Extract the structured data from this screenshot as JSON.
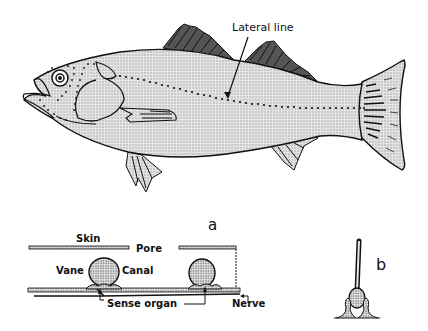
{
  "figure": {
    "fish": {
      "label_lateral_line": "Lateral line"
    },
    "panel_a": {
      "panel_label": "a",
      "labels": {
        "skin": "Skin",
        "pore": "Pore",
        "vane": "Vane",
        "canal": "Canal",
        "sense_organ": "Sense organ",
        "nerve": "Nerve"
      }
    },
    "panel_b": {
      "panel_label": "b"
    }
  },
  "colors": {
    "ink": "#111111",
    "body_fill": "#d4d4d4",
    "stipple": "#bdbdbd",
    "background": "#ffffff"
  }
}
